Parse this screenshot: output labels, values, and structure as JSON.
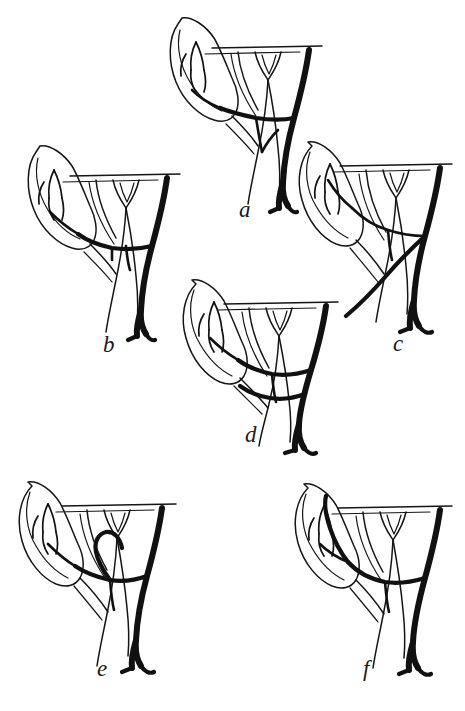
{
  "figure": {
    "kind": "anatomical-line-drawing",
    "background_color": "#ffffff",
    "ink_color": "#151515",
    "width": 465,
    "height": 711,
    "panel_count": 6
  },
  "panels": [
    {
      "id": "a",
      "label": "a",
      "label_x": 239,
      "label_y": 198,
      "origin_x": 160,
      "origin_y": 8,
      "description": "gallbladder with cystic duct and thick right-sided vessel descending",
      "variant": "cystic artery crossing anterior to common hepatic duct"
    },
    {
      "id": "b",
      "label": "b",
      "label_x": 103,
      "label_y": 333,
      "origin_x": 18,
      "origin_y": 135,
      "description": "gallbladder with short cystic artery joining low on the duct",
      "variant": "low cystic artery origin with transverse connecting branch"
    },
    {
      "id": "c",
      "label": "c",
      "label_x": 393,
      "label_y": 332,
      "origin_x": 288,
      "origin_y": 126,
      "description": "gallbladder angled with long vessel running along inferior border",
      "variant": "cystic artery running parallel to the duct"
    },
    {
      "id": "d",
      "label": "d",
      "label_x": 245,
      "label_y": 423,
      "origin_x": 172,
      "origin_y": 268,
      "description": "gallbladder rotated with vessel branching mid-trunk",
      "variant": "double branching of the cystic artery"
    },
    {
      "id": "e",
      "label": "e",
      "label_x": 97,
      "label_y": 657,
      "origin_x": 12,
      "origin_y": 468,
      "description": "gallbladder with looping recurrent vessel near the neck",
      "variant": "recurrent/looping cystic artery"
    },
    {
      "id": "f",
      "label": "f",
      "label_x": 363,
      "label_y": 657,
      "origin_x": 290,
      "origin_y": 470,
      "description": "gallbladder with vessel hugging the medial wall",
      "variant": "cystic artery adherent to gallbladder wall"
    }
  ]
}
